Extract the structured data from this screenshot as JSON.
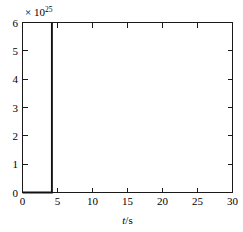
{
  "chart_data": {
    "type": "line",
    "title": "",
    "subtitle": "",
    "xlabel": "t/s",
    "xlabel_symbol": "t",
    "xlabel_unit": "/s",
    "ylabel": "",
    "y_exponent_prefix": "× 10",
    "y_exponent_power": "25",
    "y_scale_factor": 1e+25,
    "xlim": [
      0,
      30
    ],
    "ylim": [
      0,
      6
    ],
    "xticks": [
      0,
      5,
      10,
      15,
      20,
      25,
      30
    ],
    "xticklabels": [
      "0",
      "5",
      "10",
      "15",
      "20",
      "25",
      "30"
    ],
    "yticks": [
      0,
      1,
      2,
      3,
      4,
      5,
      6
    ],
    "yticklabels": [
      "0",
      "1",
      "2",
      "3",
      "4",
      "5",
      "6"
    ],
    "grid": false,
    "legend": null,
    "box": true,
    "tick_direction": "in",
    "series": [
      {
        "name": "signal",
        "color": "#111111",
        "linewidth": 1.9,
        "x": [
          0.0,
          4.1,
          4.2,
          4.2,
          4.2
        ],
        "y": [
          0.0,
          0.0,
          0.0,
          6.0,
          6.0
        ],
        "description": "flat at zero until t=4.2 s, then a vertical spike to 6e25"
      }
    ],
    "annotations": [],
    "spike": {
      "t": 4.2,
      "peak_value_scaled": 6.0,
      "peak_value": 6e+25
    }
  },
  "colors": {
    "axis": "#1a1a1a",
    "trace": "#111111",
    "background": "#ffffff",
    "text": "#000000"
  }
}
